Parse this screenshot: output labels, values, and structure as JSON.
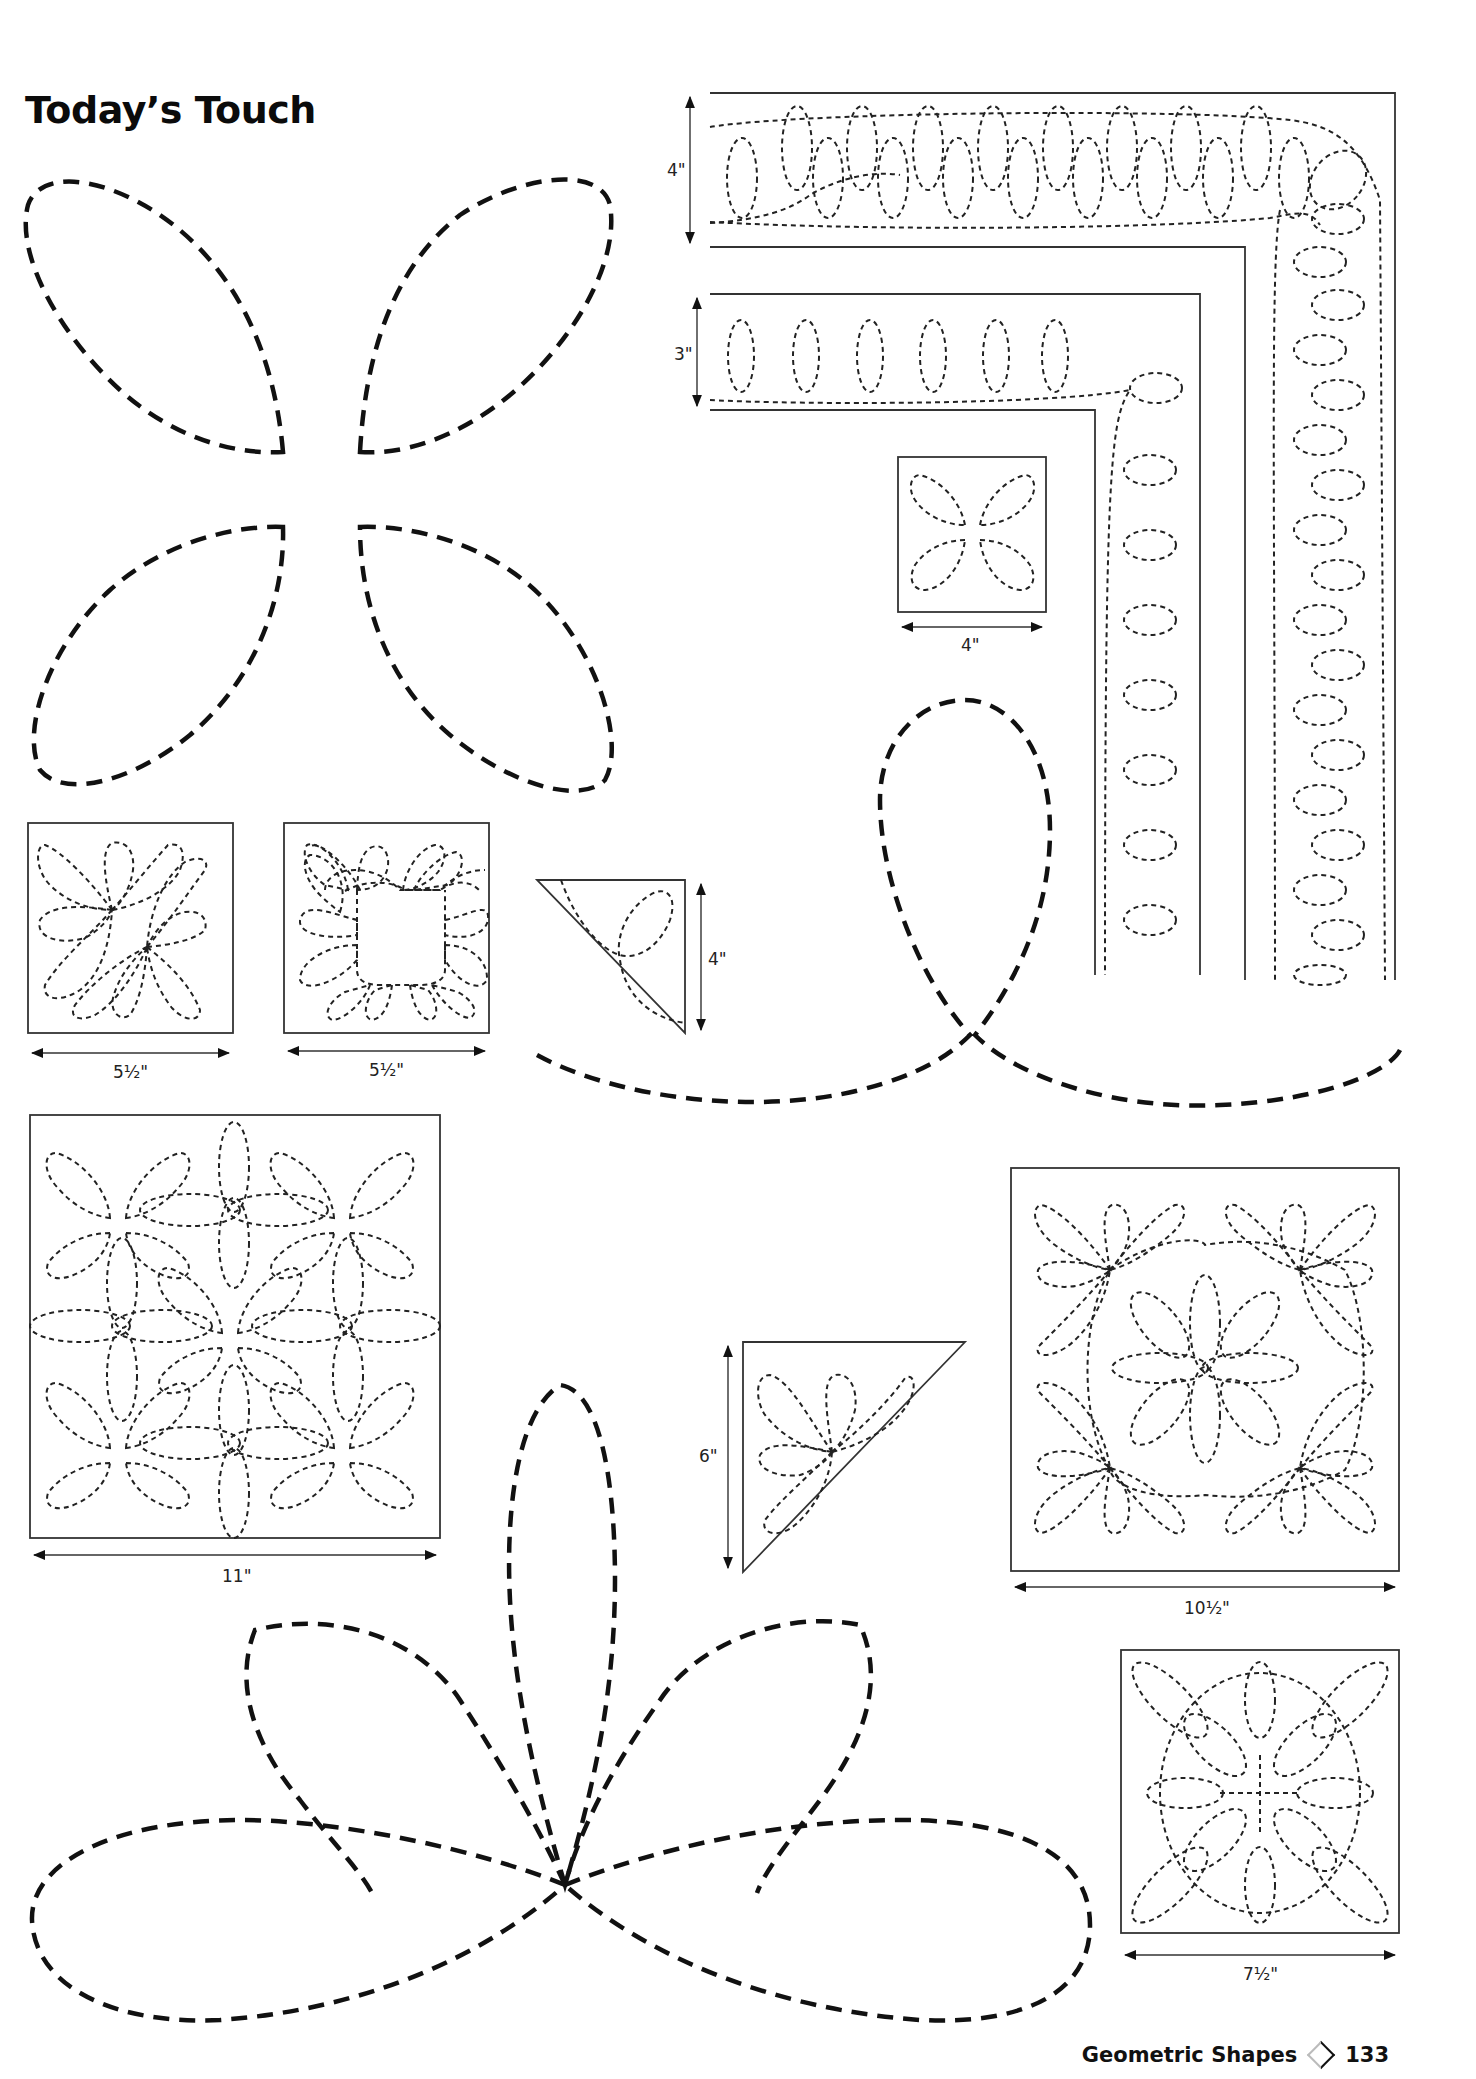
{
  "page": {
    "title": "Today’s Touch",
    "footer": {
      "section": "Geometric Shapes",
      "separator_icon": "diamond-icon",
      "page_number": "133"
    }
  },
  "patterns": [
    {
      "id": "four-petal-large",
      "type": "full-size template",
      "dimension": ""
    },
    {
      "id": "border-4in",
      "type": "border with corner",
      "dimension": "4\""
    },
    {
      "id": "border-3in",
      "type": "border with corner",
      "dimension": "3\""
    },
    {
      "id": "block-4in",
      "type": "block",
      "dimension": "4\""
    },
    {
      "id": "block-5half-a",
      "type": "block",
      "dimension": "5½\""
    },
    {
      "id": "block-5half-b",
      "type": "block",
      "dimension": "5½\""
    },
    {
      "id": "triangle-4in",
      "type": "setting triangle",
      "dimension": "4\""
    },
    {
      "id": "loop-large",
      "type": "full-size template",
      "dimension": ""
    },
    {
      "id": "block-11in",
      "type": "block",
      "dimension": "11\""
    },
    {
      "id": "triangle-6in",
      "type": "setting triangle",
      "dimension": "6\""
    },
    {
      "id": "block-10half",
      "type": "block",
      "dimension": "10½\""
    },
    {
      "id": "fan-large",
      "type": "full-size template",
      "dimension": ""
    },
    {
      "id": "block-7half",
      "type": "block",
      "dimension": "7½\""
    }
  ],
  "labels": {
    "border_4": "4\"",
    "border_3": "3\"",
    "block_4": "4\"",
    "block_5half_a": "5½\"",
    "block_5half_b": "5½\"",
    "tri_4": "4\"",
    "block_11": "11\"",
    "tri_6": "6\"",
    "block_10half": "10½\"",
    "block_7half": "7½\""
  }
}
